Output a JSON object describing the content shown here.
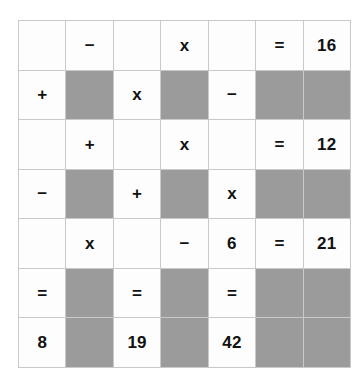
{
  "puzzle": {
    "type": "arithmetic-grid",
    "rows": 7,
    "columns": 7,
    "colors": {
      "cell_background": "#fdfdfd",
      "blocked_background": "#9b9b9b",
      "grid_line": "#c9c9c9",
      "text": "#111111",
      "page_background": "#ffffff"
    },
    "grid": [
      [
        {
          "text": "",
          "kind": "empty"
        },
        {
          "text": "−",
          "kind": "operator"
        },
        {
          "text": "",
          "kind": "empty"
        },
        {
          "text": "x",
          "kind": "operator"
        },
        {
          "text": "",
          "kind": "empty"
        },
        {
          "text": "=",
          "kind": "operator"
        },
        {
          "text": "16",
          "kind": "number"
        }
      ],
      [
        {
          "text": "+",
          "kind": "operator"
        },
        {
          "text": "",
          "kind": "blocked"
        },
        {
          "text": "x",
          "kind": "operator"
        },
        {
          "text": "",
          "kind": "blocked"
        },
        {
          "text": "−",
          "kind": "operator"
        },
        {
          "text": "",
          "kind": "blocked"
        },
        {
          "text": "",
          "kind": "blocked"
        }
      ],
      [
        {
          "text": "",
          "kind": "empty"
        },
        {
          "text": "+",
          "kind": "operator"
        },
        {
          "text": "",
          "kind": "empty"
        },
        {
          "text": "x",
          "kind": "operator"
        },
        {
          "text": "",
          "kind": "empty"
        },
        {
          "text": "=",
          "kind": "operator"
        },
        {
          "text": "12",
          "kind": "number"
        }
      ],
      [
        {
          "text": "−",
          "kind": "operator"
        },
        {
          "text": "",
          "kind": "blocked"
        },
        {
          "text": "+",
          "kind": "operator"
        },
        {
          "text": "",
          "kind": "blocked"
        },
        {
          "text": "x",
          "kind": "operator"
        },
        {
          "text": "",
          "kind": "blocked"
        },
        {
          "text": "",
          "kind": "blocked"
        }
      ],
      [
        {
          "text": "",
          "kind": "empty"
        },
        {
          "text": "x",
          "kind": "operator"
        },
        {
          "text": "",
          "kind": "empty"
        },
        {
          "text": "−",
          "kind": "operator"
        },
        {
          "text": "6",
          "kind": "number"
        },
        {
          "text": "=",
          "kind": "operator"
        },
        {
          "text": "21",
          "kind": "number"
        }
      ],
      [
        {
          "text": "=",
          "kind": "operator"
        },
        {
          "text": "",
          "kind": "blocked"
        },
        {
          "text": "=",
          "kind": "operator"
        },
        {
          "text": "",
          "kind": "blocked"
        },
        {
          "text": "=",
          "kind": "operator"
        },
        {
          "text": "",
          "kind": "blocked"
        },
        {
          "text": "",
          "kind": "blocked"
        }
      ],
      [
        {
          "text": "8",
          "kind": "number"
        },
        {
          "text": "",
          "kind": "blocked"
        },
        {
          "text": "19",
          "kind": "number"
        },
        {
          "text": "",
          "kind": "blocked"
        },
        {
          "text": "42",
          "kind": "number"
        },
        {
          "text": "",
          "kind": "blocked"
        },
        {
          "text": "",
          "kind": "blocked"
        }
      ]
    ]
  }
}
